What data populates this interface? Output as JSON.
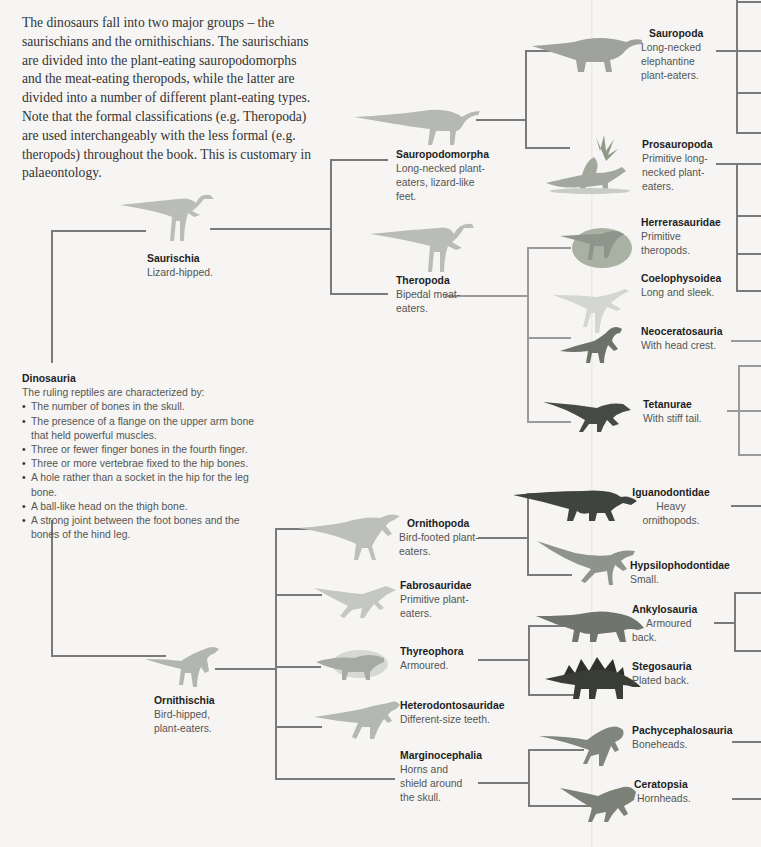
{
  "intro_text": "The dinosaurs fall into two major groups – the saurischians and the ornithischians. The saurischians are divided into the plant-eating sauropodomorphs and the meat-eating theropods, while the latter are divided into a number of different plant-eating types. Note that the formal classifications (e.g. Theropoda) are used interchangeably with the less formal (e.g. theropods) throughout the book. This is customary in palaeontology.",
  "root": {
    "title": "Dinosauria",
    "subtitle": "The ruling reptiles are characterized by:",
    "traits": [
      "The number of bones in the skull.",
      "The presence of a flange on the upper arm bone that held powerful muscles.",
      "Three or fewer finger bones in the fourth finger.",
      "Three or more vertebrae fixed to the hip bones.",
      "A hole rather than a socket in the hip for the leg bone.",
      "A ball-like head on the thigh bone.",
      "A strong joint between the foot bones and the bones of the hind leg."
    ]
  },
  "nodes": {
    "saurischia": {
      "title": "Saurischia",
      "desc": "Lizard-hipped."
    },
    "ornithischia": {
      "title": "Ornithischia",
      "desc": "Bird-hipped, plant-eaters."
    },
    "sauropodomorpha": {
      "title": "Sauropodomorpha",
      "desc": "Long-necked plant-eaters, lizard-like feet."
    },
    "theropoda": {
      "title": "Theropoda",
      "desc": "Bipedal meat-eaters."
    },
    "sauropoda": {
      "title": "Sauropoda",
      "desc": "Long-necked elephantine plant-eaters."
    },
    "prosauropoda": {
      "title": "Prosauropoda",
      "desc": "Primitive long-necked plant-eaters."
    },
    "herrerasauridae": {
      "title": "Herrerasauridae",
      "desc": "Primitive theropods."
    },
    "coelophysoidea": {
      "title": "Coelophysoidea",
      "desc": "Long and sleek."
    },
    "neoceratosauria": {
      "title": "Neoceratosauria",
      "desc": "With head crest."
    },
    "tetanurae": {
      "title": "Tetanurae",
      "desc": "With stiff tail."
    },
    "ornithopoda": {
      "title": "Ornithopoda",
      "desc": "Bird-footed plant-eaters."
    },
    "fabrosauridae": {
      "title": "Fabrosauridae",
      "desc": "Primitive plant-eaters."
    },
    "thyreophora": {
      "title": "Thyreophora",
      "desc": "Armoured."
    },
    "heterodontosauridae": {
      "title": "Heterodontosauridae",
      "desc": "Different-size teeth."
    },
    "marginocephalia": {
      "title": "Marginocephalia",
      "desc": "Horns and shield around the skull."
    },
    "iguanodontidae": {
      "title": "Iguanodontidae",
      "desc": "Heavy ornithopods."
    },
    "hypsilophodontidae": {
      "title": "Hypsilophodontidae",
      "desc": "Small."
    },
    "ankylosauria": {
      "title": "Ankylosauria",
      "desc": "Armoured back."
    },
    "stegosauria": {
      "title": "Stegosauria",
      "desc": "Plated back."
    },
    "pachycephalosauria": {
      "title": "Pachycephalosauria",
      "desc": "Boneheads."
    },
    "ceratopsia": {
      "title": "Ceratopsia",
      "desc": "Hornheads."
    }
  },
  "colors": {
    "line": "#7a7a7a",
    "sketch": "#b9bcb8",
    "dark": "#3f4440",
    "stego": "#2e302c",
    "stego_plate": "#8a3b2c"
  }
}
